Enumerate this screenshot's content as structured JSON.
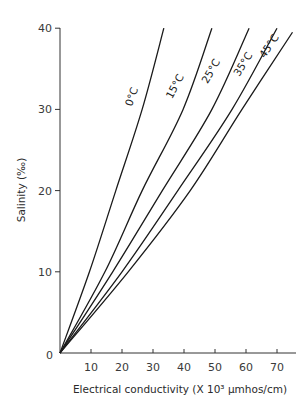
{
  "chart_data": {
    "type": "line",
    "title": "",
    "xlabel": "Electrical conductivity (X 10³ µmhos/cm)",
    "ylabel": "Salinity (‰)",
    "xlim": [
      0,
      76
    ],
    "ylim": [
      0,
      40
    ],
    "xticks": [
      10,
      20,
      30,
      40,
      50,
      60,
      70
    ],
    "yticks": [
      0,
      10,
      20,
      30,
      40
    ],
    "origin_label": "0",
    "grid": false,
    "legend": "inline labels on curves",
    "series": [
      {
        "name": "0°C",
        "x": [
          0,
          9.5,
          18,
          26.5,
          33.5
        ],
        "y": [
          0,
          10,
          20,
          30,
          40
        ],
        "label_pos": [
          135,
          98
        ],
        "label_rotate": -70
      },
      {
        "name": "15°C",
        "x": [
          0,
          14.5,
          26.5,
          39.7,
          49
        ],
        "y": [
          0,
          10,
          20,
          30,
          40
        ],
        "label_pos": [
          178,
          88
        ],
        "label_rotate": -62
      },
      {
        "name": "25°C",
        "x": [
          0,
          17,
          33,
          49,
          61
        ],
        "y": [
          0,
          10,
          20,
          30,
          40
        ],
        "label_pos": [
          214,
          73
        ],
        "label_rotate": -60
      },
      {
        "name": "35°C",
        "x": [
          0,
          20,
          38,
          55.5,
          70
        ],
        "y": [
          0,
          10,
          20,
          30,
          40
        ],
        "label_pos": [
          246,
          66
        ],
        "label_rotate": -58
      },
      {
        "name": "45°C",
        "x": [
          0,
          22,
          42,
          58.7,
          75
        ],
        "y": [
          0,
          10,
          20,
          30,
          39.5
        ],
        "label_pos": [
          272,
          48
        ],
        "label_rotate": -56
      }
    ]
  },
  "layout": {
    "origin_px": [
      60,
      353
    ],
    "x_px_per_unit": 3.1,
    "y_px_per_unit": 8.12,
    "x_axis_end_px": 296,
    "y_axis_top_px": 28
  }
}
